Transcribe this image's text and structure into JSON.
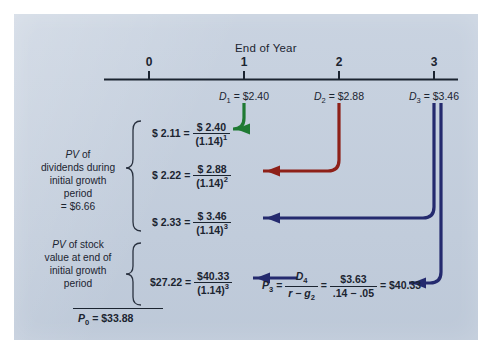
{
  "figure": {
    "panel_color": "#c3cedd",
    "timeline": {
      "axis_label": "End of Year",
      "ticks": [
        {
          "label": "0",
          "x": 149
        },
        {
          "label": "1",
          "x": 244
        },
        {
          "label": "2",
          "x": 339
        },
        {
          "label": "3",
          "x": 434
        }
      ]
    },
    "dividends": [
      {
        "name": "D",
        "sub": "1",
        "eq": "=",
        "value": "$2.40",
        "x": 244,
        "arrow_color": "#1f7a33"
      },
      {
        "name": "D",
        "sub": "2",
        "eq": "=",
        "value": "$2.88",
        "x": 339,
        "arrow_color": "#8e2018"
      },
      {
        "name": "D",
        "sub": "3",
        "eq": "=",
        "value": "$3.46",
        "x": 434,
        "arrow_color": "#242a6e"
      }
    ],
    "pv_rows": [
      {
        "pv": "$ 2.11",
        "eq": "=",
        "numerator": "$ 2.40",
        "denominator": "(1.14)",
        "exponent": "1"
      },
      {
        "pv": "$ 2.22",
        "eq": "=",
        "numerator": "$ 2.88",
        "denominator": "(1.14)",
        "exponent": "2"
      },
      {
        "pv": "$ 2.33",
        "eq": "=",
        "numerator": "$ 3.46",
        "denominator": "(1.14)",
        "exponent": "3"
      },
      {
        "pv": "$27.22",
        "eq": "=",
        "numerator": "$40.33",
        "denominator": "(1.14)",
        "exponent": "3"
      }
    ],
    "brace_labels": {
      "dividends": {
        "line1_italic": "PV",
        "line1_rest": " of",
        "line2": "dividends during",
        "line3": "initial growth",
        "line4": "period",
        "line5": "= $6.66"
      },
      "stock_value": {
        "line1_italic": "PV",
        "line1_rest": " of stock",
        "line2": "value at end of",
        "line3": "initial growth",
        "line4": "period"
      }
    },
    "gordon_formula": {
      "lhs_name": "P",
      "lhs_sub": "3",
      "eq1": "=",
      "f1_num_name": "D",
      "f1_num_sub": "4",
      "f1_den": "r − g",
      "f1_den_sub": "2",
      "eq2": "=",
      "f2_num": "$3.63",
      "f2_den": ".14 − .05",
      "eq3": "=",
      "result": "$40.33"
    },
    "total": {
      "name": "P",
      "sub": "0",
      "eq": "=",
      "value": "$33.88"
    }
  }
}
